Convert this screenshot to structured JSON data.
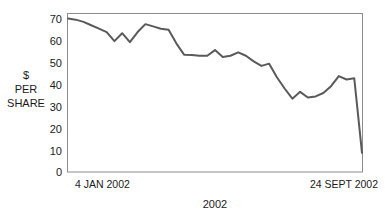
{
  "chart_data": {
    "type": "line",
    "title": "",
    "subtitle": "",
    "xlabel": "2002",
    "ylabel": "$ PER SHARE",
    "ylabel_lines": [
      "$",
      "PER",
      "SHARE"
    ],
    "ylim": [
      0,
      70
    ],
    "yticks": [
      0,
      10,
      20,
      30,
      40,
      50,
      60,
      70
    ],
    "ytick_labels": [
      "0",
      "10",
      "20",
      "30",
      "40",
      "50",
      "60",
      "70"
    ],
    "xlim": [
      0,
      38
    ],
    "xtick_labels": [
      "4 JAN 2002",
      "24 SEPT 2002"
    ],
    "x_start_label": "4 JAN 2002",
    "x_end_label": "24 SEPT 2002",
    "grid": false,
    "legend": false,
    "legend_position": "none",
    "line_color": "#5a5a5a",
    "frame_color": "#8c8c8c",
    "background": "#ffffff",
    "series": [
      {
        "name": "$ per share",
        "color": "#5a5a5a",
        "x": [
          0,
          1,
          2,
          3,
          4,
          5,
          6,
          7,
          8,
          9,
          10,
          11,
          12,
          13,
          14,
          15,
          16,
          17,
          18,
          19,
          20,
          21,
          22,
          23,
          24,
          25,
          26,
          27,
          28,
          29,
          30,
          31,
          32,
          33,
          34,
          35,
          36,
          37,
          38
        ],
        "values": [
          68,
          67.5,
          66.5,
          65,
          63.5,
          62,
          58,
          61.5,
          57.5,
          62,
          65.5,
          64.5,
          63.5,
          63,
          57,
          52,
          51.8,
          51.5,
          51.5,
          54,
          51,
          51.5,
          53,
          51.5,
          49,
          47,
          48,
          42,
          37,
          32.5,
          35.5,
          33,
          33.5,
          35,
          38,
          42.5,
          41,
          41.5,
          8.5
        ]
      }
    ]
  },
  "axis": {
    "y_title_line1": "$",
    "y_title_line2": "PER",
    "y_title_line3": "SHARE",
    "x_title": "2002",
    "x_left_date": "4 JAN 2002",
    "x_right_date": "24 SEPT 2002"
  }
}
